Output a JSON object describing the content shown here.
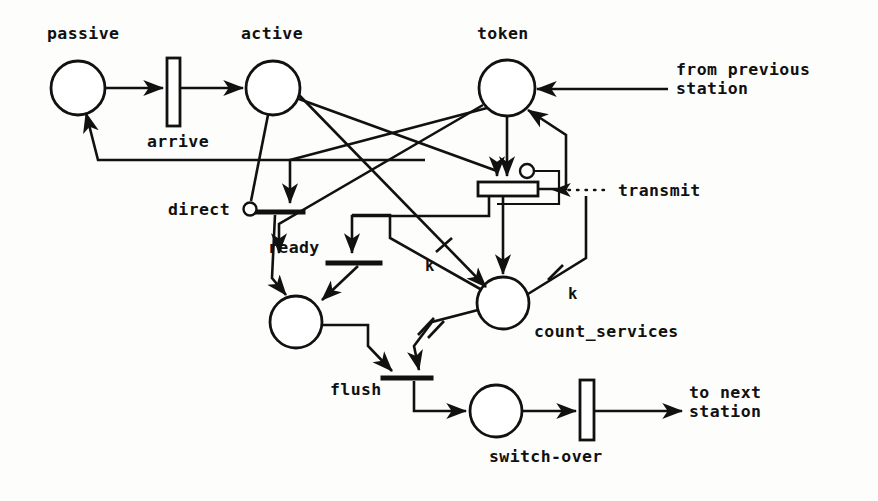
{
  "diagram": {
    "type": "petri-net"
  },
  "places": [
    {
      "id": "passive",
      "label": "passive",
      "cx": 78,
      "cy": 88,
      "r": 27
    },
    {
      "id": "active",
      "label": "active",
      "cx": 273,
      "cy": 88,
      "r": 27
    },
    {
      "id": "token",
      "label": "token",
      "cx": 507,
      "cy": 88,
      "r": 28
    },
    {
      "id": "ready_place",
      "label": "",
      "cx": 296,
      "cy": 322,
      "r": 26
    },
    {
      "id": "count_services",
      "label": "count_services",
      "cx": 503,
      "cy": 303,
      "r": 26
    },
    {
      "id": "switch_place",
      "label": "",
      "cx": 496,
      "cy": 411,
      "r": 26
    }
  ],
  "transitions": [
    {
      "id": "arrive",
      "label": "arrive",
      "shape": "box"
    },
    {
      "id": "direct",
      "label": "direct",
      "shape": "bar"
    },
    {
      "id": "ready",
      "label": "ready",
      "shape": "bar"
    },
    {
      "id": "transmit",
      "label": "transmit",
      "shape": "box"
    },
    {
      "id": "flush",
      "label": "flush",
      "shape": "bar"
    },
    {
      "id": "switch-over",
      "label": "switch-over",
      "shape": "box"
    }
  ],
  "labels": {
    "passive": "passive",
    "active": "active",
    "token": "token",
    "arrive": "arrive",
    "direct": "direct",
    "ready": "ready",
    "transmit": "transmit",
    "flush": "flush",
    "count_services": "count_services",
    "switch_over": "switch-over",
    "from_previous_line1": "from previous",
    "from_previous_line2": "station",
    "to_next_line1": "to next",
    "to_next_line2": "station",
    "k_left": "k",
    "k_right": "k"
  },
  "annotations": {
    "inhibitor_arcs": 2,
    "arc_weight_symbol": "k",
    "multiplicity_marks": 2
  },
  "colors": {
    "ink": "#111111",
    "paper": "#fdfdfc"
  }
}
